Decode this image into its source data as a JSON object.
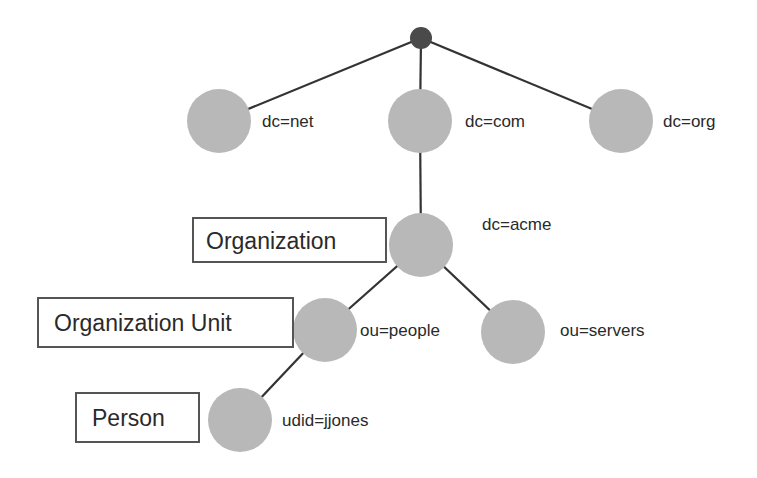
{
  "diagram": {
    "colors": {
      "node_fill": "#b8b8b8",
      "root_fill": "#4a4a4a",
      "edge": "#333333",
      "box_border": "#555555",
      "text": "#2a2a2a"
    },
    "nodes": {
      "root": {
        "label": ""
      },
      "net": {
        "label": "dc=net"
      },
      "com": {
        "label": "dc=com"
      },
      "org": {
        "label": "dc=org"
      },
      "acme": {
        "label": "dc=acme"
      },
      "people": {
        "label": "ou=people"
      },
      "servers": {
        "label": "ou=servers"
      },
      "jjones": {
        "label": "udid=jjones"
      }
    },
    "type_boxes": {
      "organization": "Organization",
      "organization_unit": "Organization Unit",
      "person": "Person"
    },
    "edges": [
      [
        "root",
        "net"
      ],
      [
        "root",
        "com"
      ],
      [
        "root",
        "org"
      ],
      [
        "com",
        "acme"
      ],
      [
        "acme",
        "people"
      ],
      [
        "acme",
        "servers"
      ],
      [
        "people",
        "jjones"
      ]
    ]
  }
}
